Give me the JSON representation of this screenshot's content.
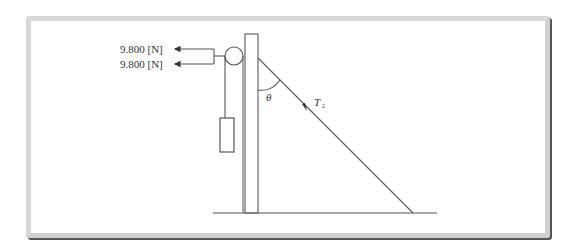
{
  "diagram": {
    "type": "mechanics-free-body",
    "forces": [
      {
        "label": "9.800 [N]",
        "direction": "left"
      },
      {
        "label": "9.800 [N]",
        "direction": "left"
      }
    ],
    "angle_label": "θ",
    "tension_label": {
      "symbol": "T",
      "subscript": "2"
    },
    "colors": {
      "line": "#555555",
      "frame_border": "#d9d9d9",
      "frame_shadow": "#555555",
      "background": "#ffffff"
    }
  }
}
